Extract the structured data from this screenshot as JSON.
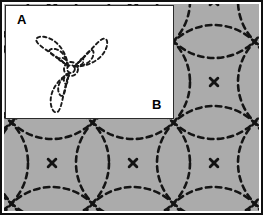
{
  "figure": {
    "width": 263,
    "height": 215,
    "background_color": "#ffffff",
    "frame_color": "#101010"
  },
  "panels": [
    {
      "id": "A",
      "label": "A",
      "label_position": {
        "x": 17,
        "y": 13
      },
      "kind": "inset",
      "background_color": "#ffffff",
      "border_color": "#2b2b2b",
      "bounds": {
        "x": 5,
        "y": 5,
        "width": 169,
        "height": 114
      },
      "description": "Single trefoil three-lobed nested dashed contour set",
      "line_color": "#1a1a1a",
      "line_style": "dashed"
    },
    {
      "id": "B",
      "label": "B",
      "label_position": {
        "x": 152,
        "y": 98
      },
      "kind": "main",
      "background_color": "#ababab",
      "bounds": {
        "x": 4,
        "y": 4,
        "width": 255,
        "height": 207
      },
      "description": "Periodic square lattice of overlapping dashed circles",
      "line_color": "#141414",
      "line_style": "dashed"
    }
  ],
  "chart_data": {
    "type": "scatter",
    "xlabel": "",
    "ylabel": "",
    "grid": false,
    "legend": "none",
    "panel_a": {
      "type": "contour",
      "center": {
        "x": 65,
        "y": 63
      },
      "core_radius": 7,
      "lobe_count": 3,
      "lobe_angles_deg": [
        138,
        40,
        250
      ],
      "lobe_length": 46,
      "lobe_width": 21,
      "contour_levels": 3,
      "contour_scales": [
        1.0,
        0.62,
        0.34
      ]
    },
    "panel_b": {
      "type": "contour",
      "lattice": "square",
      "lattice_spacing_x": 81,
      "lattice_spacing_y": 81,
      "circle_radius": 57,
      "node_points": [
        {
          "x": 48,
          "y": 159
        },
        {
          "x": 129,
          "y": 159
        },
        {
          "x": 210,
          "y": 159
        },
        {
          "x": 210,
          "y": 78
        },
        {
          "x": 129,
          "y": 78
        },
        {
          "x": 48,
          "y": 78
        },
        {
          "x": 210,
          "y": -3
        },
        {
          "x": 129,
          "y": 240
        },
        {
          "x": 48,
          "y": 240
        },
        {
          "x": 210,
          "y": 240
        },
        {
          "x": -33,
          "y": 159
        },
        {
          "x": -33,
          "y": 78
        },
        {
          "x": 291,
          "y": 159
        },
        {
          "x": 291,
          "y": 78
        },
        {
          "x": 291,
          "y": -3
        },
        {
          "x": 48,
          "y": -3
        },
        {
          "x": 129,
          "y": -3
        },
        {
          "x": -33,
          "y": -3
        },
        {
          "x": -33,
          "y": 240
        },
        {
          "x": 291,
          "y": 240
        }
      ]
    }
  }
}
